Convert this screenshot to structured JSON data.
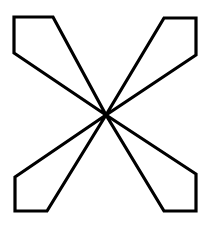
{
  "figure": {
    "background_color": "#ffffff",
    "stroke_color": "#000000",
    "fill_color": "#ffffff",
    "stroke_width": 3.2,
    "canvas": {
      "width": 211,
      "height": 229
    },
    "center_point": {
      "x": 106,
      "y": 115
    },
    "wings": [
      {
        "name": "top-left-wing",
        "points": "106,115 14,53 14,17 53,17"
      },
      {
        "name": "top-right-wing",
        "points": "106,115 164,18 196,18 196,55"
      },
      {
        "name": "bottom-left-wing",
        "points": "106,115 47,211 15,211 15,177"
      },
      {
        "name": "bottom-right-wing",
        "points": "106,115 196,174 196,211 164,211"
      }
    ]
  }
}
